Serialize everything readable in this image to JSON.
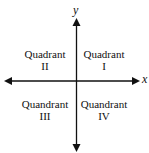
{
  "diagram": {
    "type": "cartesian-quadrants",
    "axes": {
      "x_label": "x",
      "y_label": "y",
      "color": "#111111"
    },
    "quadrants": [
      {
        "id": "I",
        "line1": "Quadrant",
        "line2": "I"
      },
      {
        "id": "II",
        "line1": "Quadrant",
        "line2": "II"
      },
      {
        "id": "III",
        "line1": "Quandrant",
        "line2": "III"
      },
      {
        "id": "IV",
        "line1": "Quandrant",
        "line2": "IV"
      }
    ]
  }
}
